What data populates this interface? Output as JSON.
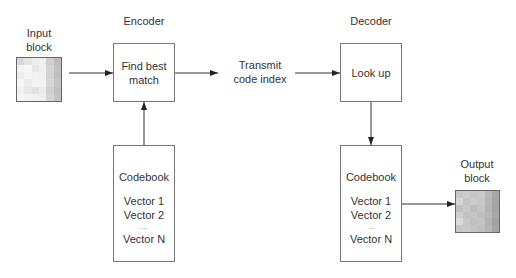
{
  "diagram": {
    "input_block": {
      "label_line1": "Input",
      "label_line2": "block",
      "pixels": [
        "#d8d8d8",
        "#e4e4e4",
        "#ececec",
        "#f0f0f0",
        "#cfcfcf",
        "#bdbdbd",
        "#f2f2f2",
        "#f6f6f6",
        "#e6e6e6",
        "#eeeeee",
        "#d4d4d4",
        "#c2c2c2",
        "#ededed",
        "#f4f4f4",
        "#f2f2f2",
        "#f0f0f0",
        "#d2d2d2",
        "#bebebe",
        "#f5f5f5",
        "#ebebeb",
        "#f3f3f3",
        "#f1f1f1",
        "#d6d6d6",
        "#c4c4c4",
        "#f0f0f0",
        "#e8e8e8",
        "#e2e2e2",
        "#ececec",
        "#d0d0d0",
        "#c0c0c0",
        "#f4f4f4",
        "#f2f2f2",
        "#f0f0f0",
        "#eeeeee",
        "#d4d4d4",
        "#c3c3c3"
      ]
    },
    "encoder": {
      "title": "Encoder",
      "box_line1": "Find best",
      "box_line2": "match"
    },
    "transmit": {
      "line1": "Transmit",
      "line2": "code index"
    },
    "decoder": {
      "title": "Decoder",
      "box_label": "Look up"
    },
    "encoder_codebook": {
      "title": "Codebook",
      "vector1": "Vector 1",
      "vector2": "Vector 2",
      "ellipsis": "...",
      "vectorN": "Vector N"
    },
    "decoder_codebook": {
      "title": "Codebook",
      "vector1": "Vector 1",
      "vector2": "Vector 2",
      "ellipsis": "...",
      "vectorN": "Vector N"
    },
    "output_block": {
      "label_line1": "Output",
      "label_line2": "block",
      "pixels": [
        "#c8c8c8",
        "#cccccc",
        "#c6c6c6",
        "#cacaca",
        "#b8b8b8",
        "#a8a8a8",
        "#d6d6d6",
        "#c4c4c4",
        "#cccccc",
        "#c8c8c8",
        "#b6b6b6",
        "#a6a6a6",
        "#c0c0c0",
        "#cacaca",
        "#bcbcbc",
        "#c4c4c4",
        "#b4b4b4",
        "#a4a4a4",
        "#cecece",
        "#c2c2c2",
        "#c6c6c6",
        "#bebebe",
        "#b8b8b8",
        "#a8a8a8",
        "#dadada",
        "#c8c8c8",
        "#c0c0c0",
        "#c4c4c4",
        "#b2b2b2",
        "#a2a2a2",
        "#c6c6c6",
        "#cacaca",
        "#c4c4c4",
        "#c0c0c0",
        "#b6b6b6",
        "#a6a6a6"
      ]
    },
    "colors": {
      "line": "#222222",
      "box_border": "#777777",
      "text": "#333333"
    }
  }
}
